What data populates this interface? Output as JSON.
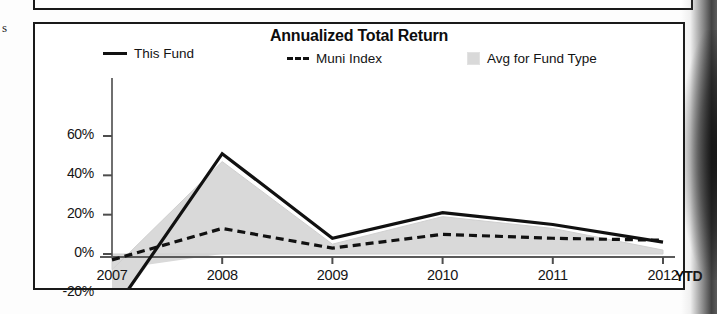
{
  "page": {
    "stray_text": "s"
  },
  "chart": {
    "title": "Annualized Total Return",
    "legend": [
      {
        "label": "This Fund",
        "marker": "solid-line-swatch",
        "color": "#111111"
      },
      {
        "label": "Muni Index",
        "marker": "dashed-line-swatch",
        "color": "#111111"
      },
      {
        "label": "Avg for Fund Type",
        "marker": "gray-box-swatch",
        "color": "#d9d9d9"
      }
    ],
    "y_ticks": [
      "60%",
      "40%",
      "20%",
      "0%",
      "-20%"
    ],
    "x_ticks": [
      "2007",
      "2008",
      "2009",
      "2010",
      "2011",
      "2012"
    ],
    "ytd_label": "YTD"
  },
  "chart_data": {
    "type": "line",
    "title": "Annualized Total Return",
    "xlabel": "",
    "ylabel": "",
    "x": [
      "2007",
      "2008",
      "2009",
      "2010",
      "2011",
      "2012"
    ],
    "categories": [
      "2007",
      "2008",
      "2009",
      "2010",
      "2011",
      "2012"
    ],
    "ylim": [
      -30,
      60
    ],
    "y_tick_values": [
      60,
      40,
      20,
      0,
      -20
    ],
    "y_tick_labels": [
      "60%",
      "40%",
      "20%",
      "0%",
      "-20%"
    ],
    "x_tick_labels": [
      "2007",
      "2008",
      "2009",
      "2010",
      "2011",
      "2012"
    ],
    "x_axis_suffix": "YTD",
    "grid": false,
    "legend_position": "top",
    "series": [
      {
        "name": "This Fund",
        "style": "solid",
        "color": "#111111",
        "values": [
          -30,
          51,
          8,
          21,
          15,
          6
        ]
      },
      {
        "name": "Muni Index",
        "style": "dashed",
        "color": "#111111",
        "values": [
          -3,
          13,
          3,
          10,
          8,
          7
        ]
      },
      {
        "name": "Avg for Fund Type",
        "style": "filled-area",
        "color": "#d9d9d9",
        "values": [
          -8,
          47,
          5,
          19,
          13,
          2
        ]
      }
    ]
  }
}
